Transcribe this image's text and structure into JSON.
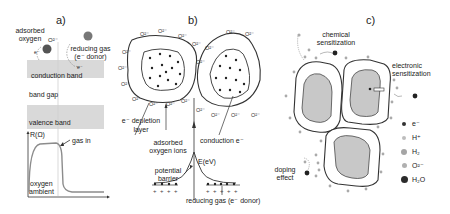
{
  "panels": {
    "a": {
      "label": "a)",
      "adsorbed_oxygen": "adsorbed",
      "adsorbed_oxygen_2": "oxygen",
      "o2_label": "O²⁻",
      "electron_label_1": "e⁻",
      "electron_label_2": "e⁻",
      "reducing_gas": "reducing gas",
      "e_donor": "(e⁻ donor)",
      "conduction_band": "conduction band",
      "band_gap": "band gap",
      "valence_band": "valence band",
      "resistance_axis": "R(Ω)",
      "gas_in": "gas in",
      "oxygen_ambient_1": "oxygen",
      "oxygen_ambient_2": "ambient"
    },
    "b": {
      "label": "b)",
      "surface_ion": "O²⁻",
      "depletion_1": "e⁻ depletion",
      "depletion_2": "layer",
      "adsorbed_ions_1": "adsorbed",
      "adsorbed_ions_2": "oxygen ions",
      "conduction_e": "conduction e⁻",
      "energy_axis": "E(eV)",
      "potential_1": "potential",
      "potential_2": "barrier",
      "reducing_gas": "reducing gas (e⁻ donor)"
    },
    "c": {
      "label": "c)",
      "chemical_1": "chemical",
      "chemical_2": "sensitization",
      "electronic_1": "electronic",
      "electronic_2": "sensitization",
      "doping_1": "doping",
      "doping_2": "effect",
      "legend": [
        {
          "label": "e⁻",
          "color": "#333333",
          "size": 2
        },
        {
          "label": "H⁺",
          "color": "#bdbdbd",
          "size": 2.2
        },
        {
          "label": "H₂",
          "color": "#a5a5a5",
          "size": 3
        },
        {
          "label": "O²⁻",
          "color": "#b0b0b0",
          "size": 2.6
        },
        {
          "label": "H₂O",
          "color": "#2b2b2b",
          "size": 3.2
        }
      ]
    }
  },
  "colors": {
    "band_fill": "#d9d9d9",
    "grain_fill": "#c8c8c8",
    "line": "#333333",
    "curve": "#8c8c8c"
  }
}
